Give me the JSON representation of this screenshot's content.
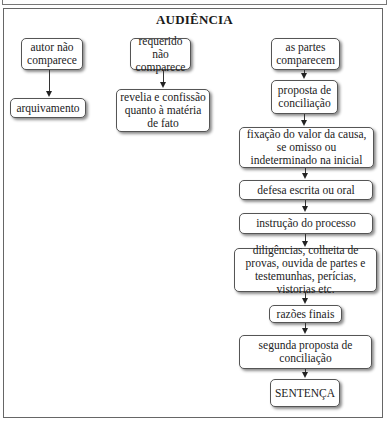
{
  "diagram": {
    "title": "AUDIÊNCIA",
    "branches": [
      {
        "id": "autor",
        "nodes": [
          {
            "label": "autor não comparece"
          },
          {
            "label": "arquivamento"
          }
        ]
      },
      {
        "id": "requerido",
        "nodes": [
          {
            "label": "requerido não comparece"
          },
          {
            "label": "revelia e confissão quanto à matéria de fato"
          }
        ]
      },
      {
        "id": "partes",
        "nodes": [
          {
            "label": "as partes comparecem"
          },
          {
            "label": "proposta de conciliação"
          },
          {
            "label": "fixação do valor da causa, se omisso ou indeterminado na inicial"
          },
          {
            "label": "defesa escrita ou oral"
          },
          {
            "label": "instrução do processo"
          },
          {
            "label": "diligências, colheita de provas, ouvida de partes e testemunhas, perícias, vistorias etc."
          },
          {
            "label": "razões finais"
          },
          {
            "label": "segunda proposta de conciliação"
          },
          {
            "label": "SENTENÇA"
          }
        ]
      }
    ],
    "colors": {
      "border": "#555555",
      "arrow": "#222222",
      "background": "#ffffff"
    }
  }
}
